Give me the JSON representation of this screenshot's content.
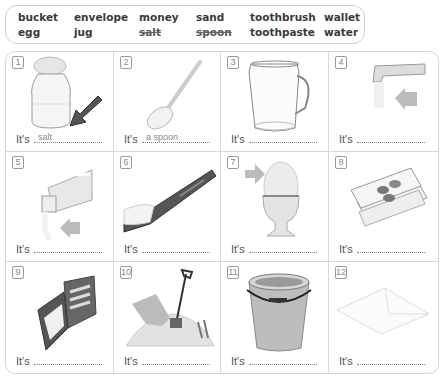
{
  "word_bank": {
    "columns": [
      {
        "top": "bucket",
        "bottom": "egg"
      },
      {
        "top": "envelope",
        "bottom": "jug"
      },
      {
        "top": "money",
        "bottom": "salt"
      },
      {
        "top": "sand",
        "bottom": "spoon"
      },
      {
        "top": "toothbrush",
        "bottom": "toothpaste"
      },
      {
        "top": "wallet",
        "bottom": "water"
      }
    ],
    "crossed_out": [
      "salt",
      "spoon"
    ]
  },
  "exercise": {
    "prompt": "It's",
    "items": [
      {
        "number": "1",
        "picture": "salt-shaker",
        "answer": "salt"
      },
      {
        "number": "2",
        "picture": "spoon",
        "answer": "a spoon"
      },
      {
        "number": "3",
        "picture": "jug",
        "answer": ""
      },
      {
        "number": "4",
        "picture": "tap-water",
        "answer": ""
      },
      {
        "number": "5",
        "picture": "toothpaste-tube",
        "answer": ""
      },
      {
        "number": "6",
        "picture": "toothbrush",
        "answer": ""
      },
      {
        "number": "7",
        "picture": "egg-in-cup",
        "answer": ""
      },
      {
        "number": "8",
        "picture": "money-notes-coins",
        "answer": ""
      },
      {
        "number": "9",
        "picture": "wallet",
        "answer": ""
      },
      {
        "number": "10",
        "picture": "sand-with-spade",
        "answer": ""
      },
      {
        "number": "11",
        "picture": "bucket",
        "answer": ""
      },
      {
        "number": "12",
        "picture": "envelope",
        "answer": ""
      }
    ]
  }
}
